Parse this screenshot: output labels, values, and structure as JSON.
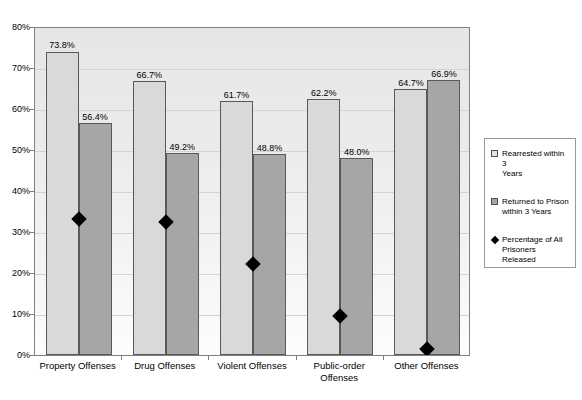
{
  "chart_data": {
    "type": "bar",
    "title": "",
    "xlabel": "",
    "ylabel": "",
    "ylim": [
      0,
      80
    ],
    "grid": true,
    "legend_position": "right",
    "categories": [
      "Property Offenses",
      "Drug Offenses",
      "Violent Offenses",
      "Public-order Offenses",
      "Other Offenses"
    ],
    "ytick_labels": [
      "0%",
      "10%",
      "20%",
      "30%",
      "40%",
      "50%",
      "60%",
      "70%",
      "80%"
    ],
    "ytick_values": [
      0,
      10,
      20,
      30,
      40,
      50,
      60,
      70,
      80
    ],
    "series": [
      {
        "name": "Rearrested within 3 Years",
        "type": "bar",
        "color": "#d9d9d9",
        "values": [
          73.8,
          66.7,
          61.7,
          62.2,
          64.7
        ],
        "data_labels": [
          "73.8%",
          "66.7%",
          "61.7%",
          "62.2%",
          "64.7%"
        ]
      },
      {
        "name": "Returned to Prison within 3 Years",
        "type": "bar",
        "color": "#a6a6a6",
        "values": [
          56.4,
          49.2,
          48.8,
          48.0,
          66.9
        ],
        "data_labels": [
          "56.4%",
          "49.2%",
          "48.8%",
          "48.0%",
          "66.9%"
        ]
      },
      {
        "name": "Percentage of All Prisoners Released",
        "type": "marker",
        "marker": "diamond",
        "color": "#000000",
        "values": [
          33.5,
          32.8,
          22.5,
          10.0,
          2.0
        ],
        "data_labels": []
      }
    ]
  },
  "legend": {
    "items": [
      {
        "label_line1": "Rearrested within 3",
        "label_line2": "Years",
        "swatch": "light-square-swatch"
      },
      {
        "label_line1": "Returned to Prison",
        "label_line2": "within 3 Years",
        "swatch": "dark-square-swatch"
      },
      {
        "label_line1": "Percentage of All",
        "label_line2": "Prisoners Released",
        "swatch": "diamond-marker"
      }
    ]
  },
  "xaxis": {
    "labels": [
      {
        "line1": "Property Offenses",
        "line2": ""
      },
      {
        "line1": "Drug Offenses",
        "line2": ""
      },
      {
        "line1": "Violent Offenses",
        "line2": ""
      },
      {
        "line1": "Public-order",
        "line2": "Offenses"
      },
      {
        "line1": "Other Offenses",
        "line2": ""
      }
    ]
  },
  "colors": {
    "bar_light": "#d9d9d9",
    "bar_dark": "#a6a6a6",
    "marker": "#000000",
    "plot_border": "#808080",
    "gridline": "#d3d3d3"
  }
}
